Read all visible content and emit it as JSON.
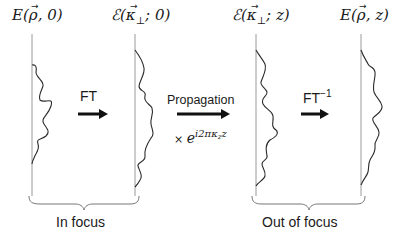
{
  "panels": [
    {
      "id": "real-space-in-focus",
      "title_main": "E(",
      "title_vec": "ρ",
      "title_rest": ", 0)"
    },
    {
      "id": "fourier-space-in-focus",
      "title_main": "ℰ(",
      "title_vec": "κ",
      "title_sub": "⊥",
      "title_rest": "; 0)"
    },
    {
      "id": "fourier-space-out-of-focus",
      "title_main": "ℰ(",
      "title_vec": "κ",
      "title_sub": "⊥",
      "title_rest": "; z)"
    },
    {
      "id": "real-space-out-of-focus",
      "title_main": "E(",
      "title_vec": "ρ",
      "title_rest": ", z)"
    }
  ],
  "arrows": [
    {
      "id": "ft",
      "label": "FT",
      "superscript": ""
    },
    {
      "id": "propagation",
      "label": "Propagation",
      "multiplier": "× e",
      "exponent": "i2πκ",
      "exponent_sub": "z",
      "exponent_tail": "z"
    },
    {
      "id": "inverse-ft",
      "label": "FT",
      "superscript": "−1"
    }
  ],
  "groups": [
    {
      "id": "in-focus",
      "label": "In focus"
    },
    {
      "id": "out-of-focus",
      "label": "Out of focus"
    }
  ],
  "colors": {
    "axis": "#9a9a9a",
    "wave": "#2a2a2a",
    "arrow": "#111111",
    "brace": "#777777",
    "text": "#1a1a1a"
  }
}
